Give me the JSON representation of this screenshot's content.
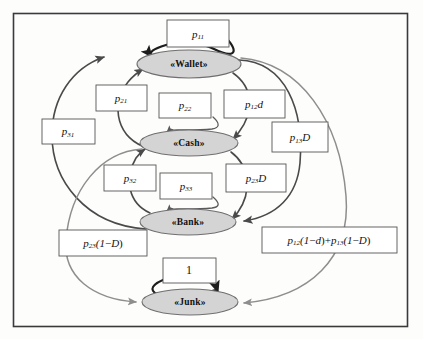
{
  "diagram": {
    "type": "state-transition-diagram",
    "frame": {
      "x": 13,
      "y": 13,
      "width": 395,
      "height": 314
    },
    "nodes": [
      {
        "id": "wallet",
        "label": "«Wallet»",
        "cx": 189,
        "cy": 64,
        "rx": 52,
        "ry": 14
      },
      {
        "id": "cash",
        "label": "«Cash»",
        "cx": 189,
        "cy": 143,
        "rx": 49,
        "ry": 13
      },
      {
        "id": "bank",
        "label": "«Bank»",
        "cx": 188,
        "cy": 222,
        "rx": 48,
        "ry": 13
      },
      {
        "id": "junk",
        "label": "«Junk»",
        "cx": 190,
        "cy": 302,
        "rx": 48,
        "ry": 13
      }
    ],
    "labels": [
      {
        "id": "p11",
        "base": "p",
        "sub": "11",
        "tail": "",
        "x": 167,
        "y": 20,
        "w": 62,
        "h": 27
      },
      {
        "id": "p21",
        "base": "p",
        "sub": "21",
        "tail": "",
        "x": 96,
        "y": 85,
        "w": 51,
        "h": 26
      },
      {
        "id": "p22",
        "base": "p",
        "sub": "22",
        "tail": "",
        "x": 159,
        "y": 93,
        "w": 52,
        "h": 25
      },
      {
        "id": "p12d",
        "base": "p",
        "sub": "12",
        "tail": "d",
        "x": 224,
        "y": 90,
        "w": 61,
        "h": 28
      },
      {
        "id": "p31",
        "base": "p",
        "sub": "31",
        "tail": "",
        "x": 42,
        "y": 119,
        "w": 53,
        "h": 25
      },
      {
        "id": "p13D",
        "base": "p",
        "sub": "13",
        "tail": "D",
        "x": 272,
        "y": 122,
        "w": 56,
        "h": 30
      },
      {
        "id": "p32",
        "base": "p",
        "sub": "32",
        "tail": "",
        "x": 104,
        "y": 165,
        "w": 52,
        "h": 26
      },
      {
        "id": "p33",
        "base": "p",
        "sub": "33",
        "tail": "",
        "x": 160,
        "y": 173,
        "w": 52,
        "h": 26
      },
      {
        "id": "p23D",
        "base": "p",
        "sub": "23",
        "tail": "D",
        "x": 226,
        "y": 164,
        "w": 60,
        "h": 28
      },
      {
        "id": "one",
        "base": "1",
        "sub": "",
        "tail": "",
        "x": 163,
        "y": 258,
        "w": 53,
        "h": 25
      }
    ],
    "formula_labels": [
      {
        "id": "p23_1mD",
        "text": "p₂₃(1−D)",
        "x": 59,
        "y": 230,
        "w": 88,
        "h": 26,
        "parts": [
          {
            "b": "p",
            "s": "23"
          },
          {
            "b": "(1−D)",
            "s": ""
          }
        ]
      },
      {
        "id": "p12_p13",
        "text": "p₁₂(1−d)+p₁₃(1−D)",
        "x": 262,
        "y": 227,
        "w": 135,
        "h": 26,
        "parts": [
          {
            "b": "p",
            "s": "12"
          },
          {
            "b": "(1−d)+",
            "s": ""
          },
          {
            "b": "p",
            "s": "13"
          },
          {
            "b": "(1−D)",
            "s": ""
          }
        ]
      }
    ],
    "colors": {
      "node_fill": "#d4d4d4",
      "node_stroke": "#6f6f6f",
      "frame": "#3a3a3a",
      "edge_dark": "#1d1d1d",
      "edge_gray": "#8e8e8e",
      "background": "#fdfdfc"
    },
    "edges": [
      {
        "id": "wallet-self",
        "from": "wallet",
        "to": "wallet",
        "label": "p11",
        "style": "dark"
      },
      {
        "id": "cash-self",
        "from": "cash",
        "to": "cash",
        "label": "p22",
        "style": "thin"
      },
      {
        "id": "bank-self",
        "from": "bank",
        "to": "bank",
        "label": "p33",
        "style": "thin"
      },
      {
        "id": "junk-self",
        "from": "junk",
        "to": "junk",
        "label": "one",
        "style": "dark"
      },
      {
        "id": "cash-wallet",
        "from": "cash",
        "to": "wallet",
        "label": "p21",
        "style": "mid"
      },
      {
        "id": "bank-wallet",
        "from": "bank",
        "to": "wallet",
        "label": "p31",
        "style": "mid"
      },
      {
        "id": "wallet-cash",
        "from": "wallet",
        "to": "cash",
        "label": "p12d",
        "style": "mid"
      },
      {
        "id": "wallet-bank",
        "from": "wallet",
        "to": "bank",
        "label": "p13D",
        "style": "mid"
      },
      {
        "id": "bank-cash",
        "from": "bank",
        "to": "cash",
        "label": "p32",
        "style": "mid"
      },
      {
        "id": "cash-bank",
        "from": "cash",
        "to": "bank",
        "label": "p23D",
        "style": "mid"
      },
      {
        "id": "cash-junk",
        "from": "cash",
        "to": "junk",
        "label": "p23_1mD",
        "style": "gray"
      },
      {
        "id": "wallet-junk",
        "from": "wallet",
        "to": "junk",
        "label": "p12_p13",
        "style": "gray"
      }
    ]
  }
}
